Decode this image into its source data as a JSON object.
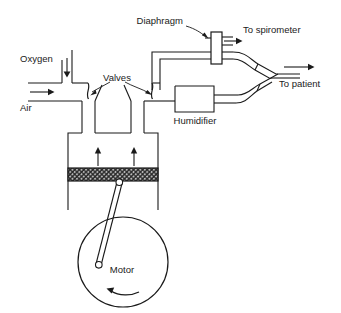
{
  "diagram": {
    "stroke_color": "#1a1a1a",
    "piston_fill": "#6b6b6b",
    "background": "#ffffff",
    "labels": {
      "oxygen": "Oxygen",
      "air": "Air",
      "valves": "Valves",
      "diaphragm": "Diaphragm",
      "to_spirometer": "To spirometer",
      "to_patient": "To patient",
      "humidifier": "Humidifier",
      "motor": "Motor"
    },
    "flow_arrows": [
      {
        "name": "oxygen-inlet-arrow",
        "direction": "down"
      },
      {
        "name": "air-inlet-arrow",
        "direction": "right"
      },
      {
        "name": "cylinder-up-arrow-left",
        "direction": "up"
      },
      {
        "name": "cylinder-up-arrow-right",
        "direction": "up"
      },
      {
        "name": "spirometer-outlet-arrow",
        "direction": "right"
      },
      {
        "name": "patient-outlet-arrow",
        "direction": "right"
      },
      {
        "name": "motor-rotation-arrow",
        "direction": "counter-clockwise"
      }
    ],
    "components": [
      "oxygen-inlet-pipe",
      "air-inlet-pipe",
      "inlet-valve",
      "outlet-valve",
      "cylinder",
      "piston",
      "connecting-rod",
      "motor-wheel",
      "humidifier-box",
      "diaphragm-valve",
      "spirometer-tube",
      "y-piece",
      "patient-tube"
    ]
  }
}
